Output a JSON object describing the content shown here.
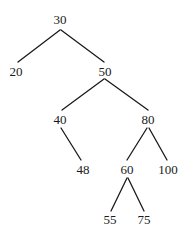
{
  "diagram": {
    "type": "binary-search-tree",
    "colors": {
      "stroke": "#1a1a1a",
      "text": "#1a1a1a",
      "background": "#ffffff"
    },
    "nodes": [
      {
        "id": "n30",
        "label": "30",
        "x": 60,
        "y": 24
      },
      {
        "id": "n20",
        "label": "20",
        "x": 16,
        "y": 76
      },
      {
        "id": "n50",
        "label": "50",
        "x": 105,
        "y": 76
      },
      {
        "id": "n40",
        "label": "40",
        "x": 60,
        "y": 124
      },
      {
        "id": "n80",
        "label": "80",
        "x": 148,
        "y": 124
      },
      {
        "id": "n48",
        "label": "48",
        "x": 83,
        "y": 174
      },
      {
        "id": "n60",
        "label": "60",
        "x": 127,
        "y": 174
      },
      {
        "id": "n100",
        "label": "100",
        "x": 168,
        "y": 174
      },
      {
        "id": "n55",
        "label": "55",
        "x": 110,
        "y": 224
      },
      {
        "id": "n75",
        "label": "75",
        "x": 144,
        "y": 224
      }
    ],
    "edges": [
      {
        "from": "30",
        "to": "20",
        "x1": 60,
        "y1": 30,
        "x2": 18,
        "y2": 62
      },
      {
        "from": "30",
        "to": "50",
        "x1": 61,
        "y1": 30,
        "x2": 104,
        "y2": 62
      },
      {
        "from": "50",
        "to": "40",
        "x1": 104,
        "y1": 79,
        "x2": 62,
        "y2": 110
      },
      {
        "from": "50",
        "to": "80",
        "x1": 105,
        "y1": 79,
        "x2": 148,
        "y2": 110
      },
      {
        "from": "40",
        "to": "48",
        "x1": 61,
        "y1": 128,
        "x2": 81,
        "y2": 160
      },
      {
        "from": "80",
        "to": "60",
        "x1": 147,
        "y1": 128,
        "x2": 127,
        "y2": 160
      },
      {
        "from": "80",
        "to": "100",
        "x1": 149,
        "y1": 128,
        "x2": 167,
        "y2": 160
      },
      {
        "from": "60",
        "to": "55",
        "x1": 127,
        "y1": 178,
        "x2": 111,
        "y2": 211
      },
      {
        "from": "60",
        "to": "75",
        "x1": 128,
        "y1": 178,
        "x2": 144,
        "y2": 211
      }
    ]
  }
}
